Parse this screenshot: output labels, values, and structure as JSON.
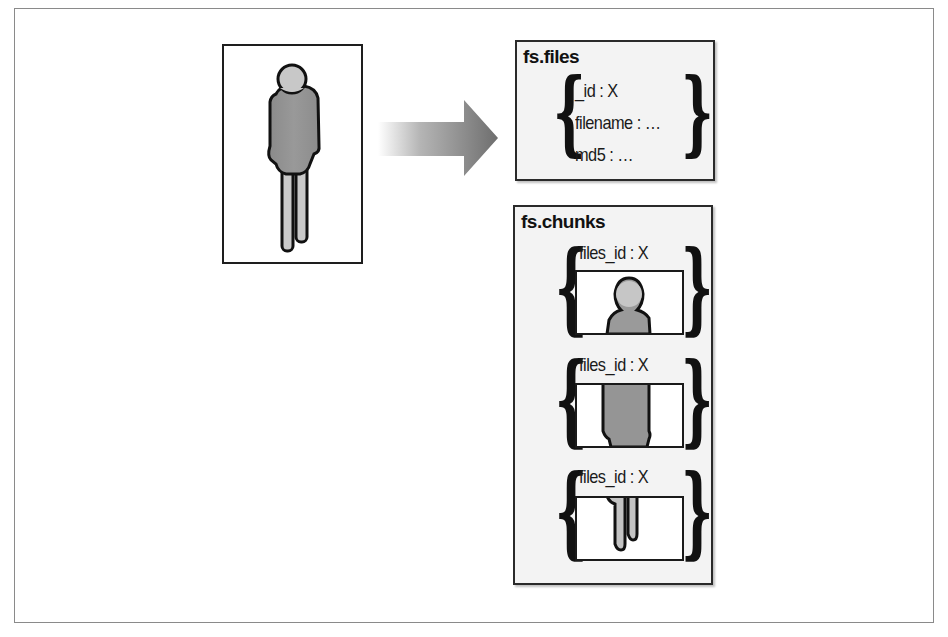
{
  "diagram": {
    "type": "GridFS storage illustration",
    "source_file": {
      "label": "file (person image)",
      "icon": "person-figure-icon"
    },
    "arrow": {
      "direction": "right",
      "icon": "arrow-right-icon"
    },
    "files_collection": {
      "title": "fs.files",
      "fields": [
        {
          "key": "_id",
          "sep": " : ",
          "value": "X"
        },
        {
          "key": "filename",
          "sep": " : ",
          "value": "…"
        },
        {
          "key": "md5",
          "sep": " : ",
          "value": "…"
        }
      ]
    },
    "chunks_collection": {
      "title": "fs.chunks",
      "chunks": [
        {
          "field": "files_id : X",
          "slice": "head"
        },
        {
          "field": "files_id : X",
          "slice": "body"
        },
        {
          "field": "files_id : X",
          "slice": "legs"
        }
      ]
    },
    "colors": {
      "figure_fill": "#8f8f8f",
      "figure_light": "#c8c8c8",
      "outline": "#1a1a1a",
      "box_bg": "#f3f3f3"
    }
  }
}
